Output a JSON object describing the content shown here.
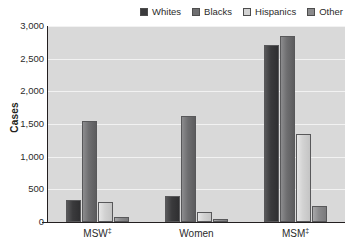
{
  "chart_data": {
    "type": "bar",
    "title": "",
    "xlabel": "",
    "ylabel": "Cases",
    "ylim": [
      0,
      3000
    ],
    "ytick_labels": [
      "3,000",
      "2,500",
      "2,000",
      "1,500",
      "1,000",
      "500",
      "0"
    ],
    "ytick_values": [
      3000,
      2500,
      2000,
      1500,
      1000,
      500,
      0
    ],
    "grid": true,
    "legend_position": "top-right",
    "categories": [
      "MSW‡",
      "Women",
      "MSM‡"
    ],
    "category_labels_plain": [
      "MSW",
      "Women",
      "MSM"
    ],
    "category_footnote_marks": [
      "‡",
      "",
      "‡"
    ],
    "series": [
      {
        "name": "Whites",
        "color": "#3a3a3c",
        "values": [
          340,
          400,
          2710
        ]
      },
      {
        "name": "Blacks",
        "color": "#6e6e70",
        "values": [
          1540,
          1630,
          2850
        ]
      },
      {
        "name": "Hispanics",
        "color": "#d2d2d2",
        "values": [
          300,
          150,
          1340
        ]
      },
      {
        "name": "Other",
        "color": "#8a8a8c",
        "values": [
          70,
          50,
          250
        ]
      }
    ]
  },
  "legend": {
    "items": [
      {
        "label": "Whites"
      },
      {
        "label": "Blacks"
      },
      {
        "label": "Hispanics"
      },
      {
        "label": "Other"
      }
    ]
  },
  "axes": {
    "y_title": "Cases"
  },
  "colors": {
    "plot_background": "#d9d9d9",
    "gridline": "#f2f2f2",
    "axis": "#231f20",
    "text": "#2b2b2b"
  }
}
